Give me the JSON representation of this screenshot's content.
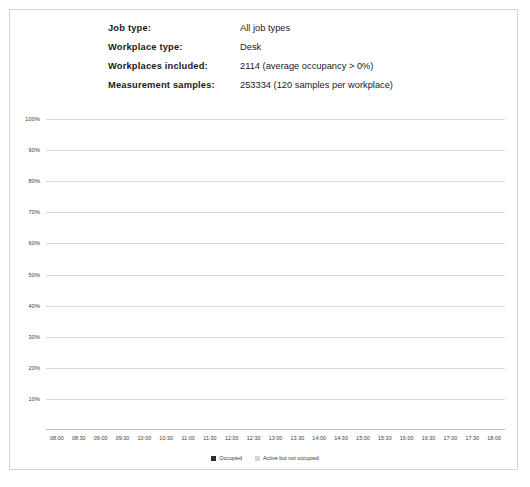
{
  "meta": {
    "rows": [
      {
        "label": "Job type:",
        "value": "All job types"
      },
      {
        "label": "Workplace type:",
        "value": "Desk"
      },
      {
        "label": "Workplaces included:",
        "value": "2114  (average  occupancy > 0%)"
      },
      {
        "label": "Measurement  samples:",
        "value": "253334 (120 samples per workplace)"
      }
    ]
  },
  "colors": {
    "occupied": "#2b2b2b",
    "active_not_occupied": "#d5d5d5",
    "gridline": "#d9d9d9",
    "frame_border": "#d4d4d4",
    "text": "#1a1a1a"
  },
  "chart_data": {
    "type": "bar",
    "stacked": true,
    "title": "",
    "xlabel": "",
    "ylabel": "",
    "ylim": [
      0,
      100
    ],
    "ytick_labels": [
      "100%",
      "90%",
      "80%",
      "70%",
      "60%",
      "50%",
      "40%",
      "30%",
      "20%",
      "10%"
    ],
    "ytick_values": [
      100,
      90,
      80,
      70,
      60,
      50,
      40,
      30,
      20,
      10
    ],
    "grid": true,
    "legend_position": "bottom",
    "categories": [
      "08:00",
      "08:30",
      "09:00",
      "09:30",
      "10:00",
      "10:30",
      "11:00",
      "11:30",
      "12:00",
      "12:30",
      "13:00",
      "13:30",
      "14:00",
      "14:30",
      "15:00",
      "15:30",
      "16:00",
      "16:30",
      "17:00",
      "17:30",
      "18:00"
    ],
    "series": [
      {
        "name": "Occupied",
        "color": "#2b2b2b",
        "values": [
          5,
          13,
          23,
          33,
          37,
          37.5,
          40.5,
          40.5,
          40,
          38,
          38,
          38,
          38.5,
          40,
          40,
          40,
          39.5,
          36,
          29.5,
          21,
          14
        ]
      },
      {
        "name": "Active but not occupied",
        "color": "#d5d5d5",
        "values": [
          1.5,
          2,
          3,
          4,
          6.5,
          6,
          6.5,
          6,
          5.5,
          5.5,
          5,
          4.5,
          4.5,
          5.5,
          5.5,
          5.5,
          5.5,
          7,
          4.5,
          1.5,
          1
        ]
      }
    ],
    "totals": [
      6.5,
      15,
      26,
      37,
      43.5,
      43.5,
      47,
      46.5,
      45.5,
      43.5,
      43,
      42.5,
      43,
      45.5,
      45.5,
      45.5,
      45,
      43,
      34,
      22.5,
      15
    ]
  },
  "legend": {
    "items": [
      {
        "label": "Occupied",
        "color": "#2b2b2b"
      },
      {
        "label": "Active but not occupied",
        "color": "#d5d5d5"
      }
    ]
  }
}
